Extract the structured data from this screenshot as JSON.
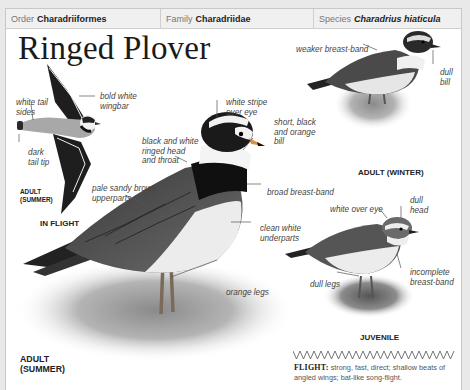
{
  "header": {
    "order_label": "Order",
    "order_value": "Charadriiformes",
    "family_label": "Family",
    "family_value": "Charadriidae",
    "species_label": "Species",
    "species_value": "Charadrius hiaticula"
  },
  "title": "Ringed Plover",
  "in_flight": {
    "labels": {
      "white_tail_sides": [
        "white tail",
        "sides"
      ],
      "bold_white_wingbar": [
        "bold white",
        "wingbar"
      ],
      "dark_tail_tip": [
        "dark",
        "tail tip"
      ]
    },
    "age_caption": [
      "ADULT",
      "(SUMMER)"
    ],
    "caption": "IN FLIGHT"
  },
  "adult_summer": {
    "labels": {
      "white_stripe": [
        "white stripe",
        "over eye"
      ],
      "bill": [
        "short, black",
        "and orange",
        "bill"
      ],
      "ringed_head": [
        "black and white",
        "ringed head",
        "and throat"
      ],
      "upperparts": [
        "pale sandy brown",
        "upperparts"
      ],
      "breast_band": [
        "broad breast-band"
      ],
      "underparts": [
        "clean white",
        "underparts"
      ],
      "legs": [
        "orange legs"
      ]
    },
    "caption": [
      "ADULT",
      "(SUMMER)"
    ]
  },
  "adult_winter": {
    "labels": {
      "breast_band": [
        "weaker breast-band"
      ],
      "bill": [
        "dull",
        "bill"
      ]
    },
    "caption": "ADULT (WINTER)"
  },
  "juvenile": {
    "labels": {
      "white_over_eye": [
        "white over eye"
      ],
      "dull_head": [
        "dull",
        "head"
      ],
      "breast_band": [
        "incomplete",
        "breast-band"
      ],
      "dull_legs": [
        "dull legs"
      ]
    },
    "caption": "JUVENILE"
  },
  "flight_pattern": {
    "icon": "zigzag-flight-pattern-icon",
    "label": "FLIGHT:",
    "text": "strong, fast, direct; shallow beats of angled wings; bat-like song-flight."
  }
}
